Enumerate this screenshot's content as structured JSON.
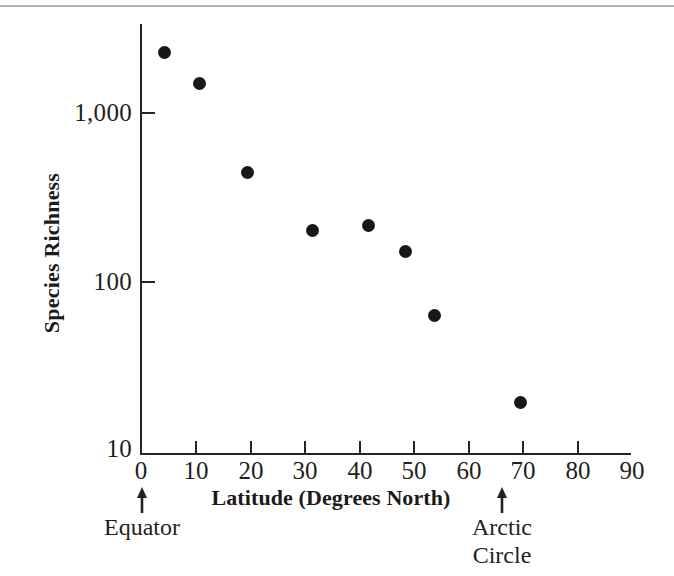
{
  "chart_data": {
    "type": "scatter",
    "title": "",
    "xlabel": "Latitude (Degrees North)",
    "ylabel": "Species Richness",
    "xlim": [
      0,
      90
    ],
    "ylim": [
      10,
      3000
    ],
    "yscale": "log",
    "grid": false,
    "legend": null,
    "x_ticks": [
      "0",
      "10",
      "20",
      "30",
      "40",
      "50",
      "60",
      "70",
      "80",
      "90"
    ],
    "x_tick_values": [
      0,
      10,
      20,
      30,
      40,
      50,
      60,
      70,
      80,
      90
    ],
    "y_ticks": [
      "10",
      "100",
      "1,000"
    ],
    "y_tick_values": [
      10,
      100,
      1000
    ],
    "series": [
      {
        "name": "Species richness vs latitude",
        "marker": "filled-circle",
        "color": "#1a1718",
        "points": [
          {
            "x": 4.3,
            "y": 2260
          },
          {
            "x": 10.7,
            "y": 1480
          },
          {
            "x": 19.5,
            "y": 450
          },
          {
            "x": 31.4,
            "y": 205
          },
          {
            "x": 41.8,
            "y": 220
          },
          {
            "x": 48.6,
            "y": 155
          },
          {
            "x": 53.8,
            "y": 65
          },
          {
            "x": 69.6,
            "y": 20
          }
        ]
      }
    ],
    "annotations": [
      {
        "label": "Equator",
        "x": 0,
        "arrow": "up"
      },
      {
        "label": "Arctic\nCircle",
        "x": 65,
        "arrow": "up"
      }
    ]
  },
  "annotations": {
    "equator": {
      "label": "Equator"
    },
    "arctic_line1": {
      "label": "Arctic"
    },
    "arctic_line2": {
      "label": "Circle"
    }
  },
  "colors": {
    "marker": "#1a1718",
    "axis": "#272425",
    "text": "#231f20",
    "rule": "#9a9a9a",
    "background": "#ffffff"
  }
}
